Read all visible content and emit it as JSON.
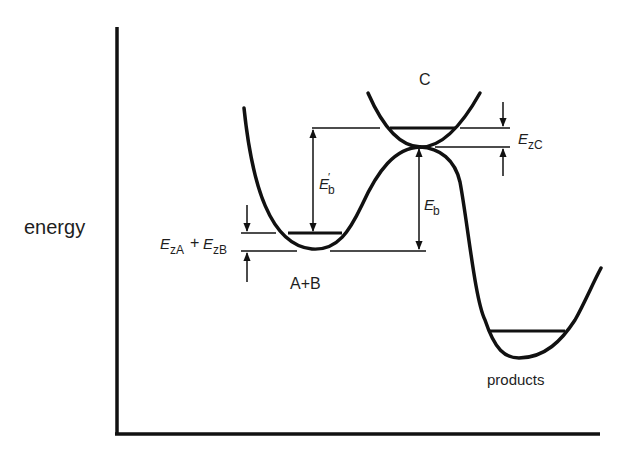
{
  "diagram": {
    "type": "potential-energy-profile",
    "y_axis_label": "energy",
    "colors": {
      "ink": "#111111",
      "text": "#1e1e1e",
      "background": "#ffffff"
    },
    "states": [
      {
        "id": "reactants",
        "label": "A+B"
      },
      {
        "id": "complex",
        "label": "C"
      },
      {
        "id": "products",
        "label": "products"
      }
    ],
    "annotations": {
      "zero_point_reactants": {
        "E1": "E",
        "sub1": "zA",
        "plus": "+",
        "E2": "E",
        "sub2": "zB"
      },
      "zero_point_complex": {
        "E": "E",
        "sub": "zC"
      },
      "barrier_classical": {
        "E": "E",
        "sub": "b"
      },
      "barrier_effective": {
        "E": "E",
        "prime": "′",
        "sub": "b"
      }
    }
  }
}
